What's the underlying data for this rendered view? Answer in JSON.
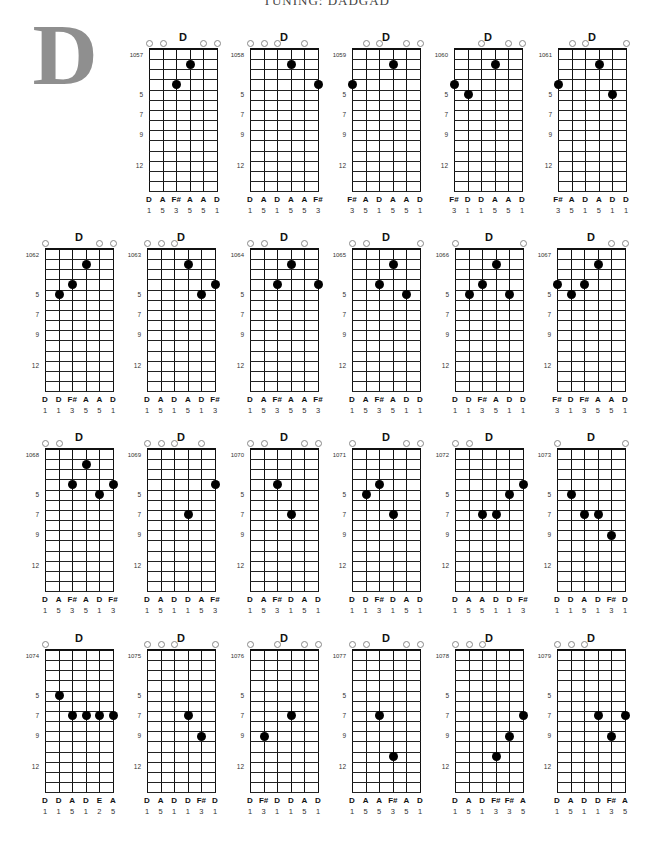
{
  "header": {
    "text": "TUNING: DADGAD"
  },
  "section_letter": "D",
  "layout": {
    "row_tops": [
      49,
      249,
      449,
      650
    ],
    "row1_lefts": [
      149,
      250,
      352,
      454,
      558
    ],
    "row_lefts": [
      45,
      147,
      250,
      352,
      455,
      557
    ],
    "string_spacing": 13.6,
    "fret_spacing": 10.15,
    "num_frets": 14
  },
  "fret_markers": [
    "5",
    "7",
    "9",
    "12"
  ],
  "charts": [
    {
      "number": "1057",
      "title": "D",
      "open": [
        1,
        2,
        5,
        6
      ],
      "dots": [
        [
          3,
          4
        ],
        [
          4,
          2
        ]
      ],
      "notes": [
        "D",
        "A",
        "F#",
        "A",
        "A",
        "D"
      ],
      "fingers": [
        "1",
        "5",
        "3",
        "5",
        "5",
        "1"
      ]
    },
    {
      "number": "1058",
      "title": "D",
      "open": [
        1,
        2,
        3,
        5
      ],
      "dots": [
        [
          4,
          2
        ],
        [
          6,
          4
        ]
      ],
      "notes": [
        "D",
        "A",
        "D",
        "A",
        "A",
        "F#"
      ],
      "fingers": [
        "1",
        "5",
        "1",
        "5",
        "5",
        "3"
      ]
    },
    {
      "number": "1059",
      "title": "D",
      "open": [
        2,
        3,
        5,
        6
      ],
      "dots": [
        [
          1,
          4
        ],
        [
          4,
          2
        ]
      ],
      "notes": [
        "F#",
        "A",
        "D",
        "A",
        "A",
        "D"
      ],
      "fingers": [
        "3",
        "5",
        "1",
        "5",
        "5",
        "1"
      ]
    },
    {
      "number": "1060",
      "title": "D",
      "open": [
        3,
        5,
        6
      ],
      "dots": [
        [
          1,
          4
        ],
        [
          2,
          5
        ],
        [
          4,
          2
        ]
      ],
      "notes": [
        "F#",
        "D",
        "D",
        "A",
        "A",
        "D"
      ],
      "fingers": [
        "3",
        "1",
        "1",
        "5",
        "5",
        "1"
      ]
    },
    {
      "number": "1061",
      "title": "D",
      "open": [
        2,
        3,
        6
      ],
      "dots": [
        [
          1,
          4
        ],
        [
          4,
          2
        ],
        [
          5,
          5
        ]
      ],
      "notes": [
        "F#",
        "A",
        "D",
        "A",
        "D",
        "D"
      ],
      "fingers": [
        "3",
        "5",
        "1",
        "5",
        "1",
        "1"
      ]
    },
    {
      "number": "1062",
      "title": "D",
      "open": [
        1,
        5,
        6
      ],
      "dots": [
        [
          2,
          5
        ],
        [
          3,
          4
        ],
        [
          4,
          2
        ]
      ],
      "notes": [
        "D",
        "D",
        "F#",
        "A",
        "A",
        "D"
      ],
      "fingers": [
        "1",
        "1",
        "3",
        "5",
        "5",
        "1"
      ]
    },
    {
      "number": "1063",
      "title": "D",
      "open": [
        1,
        2,
        3
      ],
      "dots": [
        [
          4,
          2
        ],
        [
          5,
          5
        ],
        [
          6,
          4
        ]
      ],
      "notes": [
        "D",
        "A",
        "D",
        "A",
        "D",
        "F#"
      ],
      "fingers": [
        "1",
        "5",
        "1",
        "5",
        "1",
        "3"
      ]
    },
    {
      "number": "1064",
      "title": "D",
      "open": [
        1,
        2,
        5
      ],
      "dots": [
        [
          3,
          4
        ],
        [
          4,
          2
        ],
        [
          6,
          4
        ]
      ],
      "notes": [
        "D",
        "A",
        "F#",
        "A",
        "A",
        "F#"
      ],
      "fingers": [
        "1",
        "5",
        "3",
        "5",
        "5",
        "3"
      ]
    },
    {
      "number": "1065",
      "title": "D",
      "open": [
        1,
        2,
        6
      ],
      "dots": [
        [
          3,
          4
        ],
        [
          4,
          2
        ],
        [
          5,
          5
        ]
      ],
      "notes": [
        "D",
        "A",
        "F#",
        "A",
        "D",
        "D"
      ],
      "fingers": [
        "1",
        "5",
        "3",
        "5",
        "1",
        "1"
      ]
    },
    {
      "number": "1066",
      "title": "D",
      "open": [
        1,
        6
      ],
      "dots": [
        [
          2,
          5
        ],
        [
          3,
          4
        ],
        [
          4,
          2
        ],
        [
          5,
          5
        ]
      ],
      "notes": [
        "D",
        "D",
        "F#",
        "A",
        "D",
        "D"
      ],
      "fingers": [
        "1",
        "1",
        "3",
        "5",
        "1",
        "1"
      ]
    },
    {
      "number": "1067",
      "title": "D",
      "open": [
        5,
        6
      ],
      "dots": [
        [
          1,
          4
        ],
        [
          2,
          5
        ],
        [
          3,
          4
        ],
        [
          4,
          2
        ]
      ],
      "notes": [
        "F#",
        "D",
        "F#",
        "A",
        "A",
        "D"
      ],
      "fingers": [
        "3",
        "1",
        "3",
        "5",
        "5",
        "1"
      ]
    },
    {
      "number": "1068",
      "title": "D",
      "open": [
        1,
        2
      ],
      "dots": [
        [
          3,
          4
        ],
        [
          4,
          2
        ],
        [
          5,
          5
        ],
        [
          6,
          4
        ]
      ],
      "notes": [
        "D",
        "A",
        "F#",
        "A",
        "D",
        "F#"
      ],
      "fingers": [
        "1",
        "5",
        "3",
        "5",
        "1",
        "3"
      ]
    },
    {
      "number": "1069",
      "title": "D",
      "open": [
        1,
        2,
        3,
        5
      ],
      "dots": [
        [
          4,
          7
        ],
        [
          6,
          4
        ]
      ],
      "notes": [
        "D",
        "A",
        "D",
        "D",
        "A",
        "F#"
      ],
      "fingers": [
        "1",
        "5",
        "1",
        "1",
        "5",
        "3"
      ]
    },
    {
      "number": "1070",
      "title": "D",
      "open": [
        1,
        2,
        5,
        6
      ],
      "dots": [
        [
          3,
          4
        ],
        [
          4,
          7
        ]
      ],
      "notes": [
        "D",
        "A",
        "F#",
        "D",
        "A",
        "D"
      ],
      "fingers": [
        "1",
        "5",
        "3",
        "1",
        "5",
        "1"
      ]
    },
    {
      "number": "1071",
      "title": "D",
      "open": [
        1,
        5,
        6
      ],
      "dots": [
        [
          2,
          5
        ],
        [
          3,
          4
        ],
        [
          4,
          7
        ]
      ],
      "notes": [
        "D",
        "D",
        "F#",
        "D",
        "A",
        "D"
      ],
      "fingers": [
        "1",
        "1",
        "3",
        "1",
        "5",
        "1"
      ]
    },
    {
      "number": "1072",
      "title": "D",
      "open": [
        1,
        2
      ],
      "dots": [
        [
          3,
          7
        ],
        [
          4,
          7
        ],
        [
          5,
          5
        ],
        [
          6,
          4
        ]
      ],
      "notes": [
        "D",
        "A",
        "A",
        "D",
        "D",
        "F#"
      ],
      "fingers": [
        "1",
        "5",
        "5",
        "1",
        "1",
        "3"
      ]
    },
    {
      "number": "1073",
      "title": "D",
      "open": [
        1,
        6
      ],
      "dots": [
        [
          2,
          5
        ],
        [
          3,
          7
        ],
        [
          4,
          7
        ],
        [
          5,
          9
        ]
      ],
      "notes": [
        "D",
        "D",
        "A",
        "D",
        "F#",
        "D"
      ],
      "fingers": [
        "1",
        "1",
        "5",
        "1",
        "3",
        "1"
      ]
    },
    {
      "number": "1074",
      "title": "D",
      "open": [
        1
      ],
      "dots": [
        [
          2,
          5
        ],
        [
          3,
          7
        ],
        [
          4,
          7
        ],
        [
          5,
          7
        ],
        [
          6,
          7
        ]
      ],
      "notes": [
        "D",
        "D",
        "A",
        "D",
        "E",
        "A"
      ],
      "fingers": [
        "1",
        "1",
        "5",
        "1",
        "2",
        "5"
      ]
    },
    {
      "number": "1075",
      "title": "D",
      "open": [
        1,
        2,
        3,
        6
      ],
      "dots": [
        [
          4,
          7
        ],
        [
          5,
          9
        ]
      ],
      "notes": [
        "D",
        "A",
        "D",
        "D",
        "F#",
        "D"
      ],
      "fingers": [
        "1",
        "5",
        "1",
        "1",
        "3",
        "1"
      ]
    },
    {
      "number": "1076",
      "title": "D",
      "open": [
        1,
        3,
        5,
        6
      ],
      "dots": [
        [
          2,
          9
        ],
        [
          4,
          7
        ]
      ],
      "notes": [
        "D",
        "F#",
        "D",
        "D",
        "A",
        "D"
      ],
      "fingers": [
        "1",
        "3",
        "1",
        "1",
        "5",
        "1"
      ]
    },
    {
      "number": "1077",
      "title": "D",
      "open": [
        1,
        2,
        5,
        6
      ],
      "dots": [
        [
          3,
          7
        ],
        [
          4,
          11
        ]
      ],
      "notes": [
        "D",
        "A",
        "A",
        "F#",
        "A",
        "D"
      ],
      "fingers": [
        "1",
        "5",
        "5",
        "3",
        "5",
        "1"
      ]
    },
    {
      "number": "1078",
      "title": "D",
      "open": [
        1,
        2,
        3
      ],
      "dots": [
        [
          4,
          11
        ],
        [
          5,
          9
        ],
        [
          6,
          7
        ]
      ],
      "notes": [
        "D",
        "A",
        "D",
        "F#",
        "F#",
        "A"
      ],
      "fingers": [
        "1",
        "5",
        "1",
        "3",
        "3",
        "5"
      ]
    },
    {
      "number": "1079",
      "title": "D",
      "open": [
        1,
        2,
        3
      ],
      "dots": [
        [
          4,
          7
        ],
        [
          5,
          9
        ],
        [
          6,
          7
        ]
      ],
      "notes": [
        "D",
        "A",
        "D",
        "D",
        "F#",
        "A"
      ],
      "fingers": [
        "1",
        "5",
        "1",
        "1",
        "3",
        "5"
      ]
    }
  ]
}
